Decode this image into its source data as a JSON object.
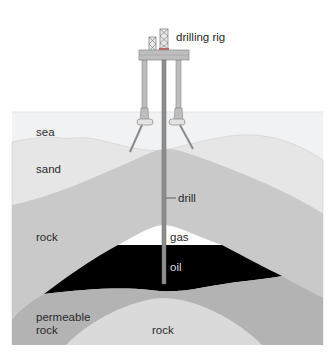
{
  "diagram": {
    "labels": {
      "drilling_rig": "drilling rig",
      "sea": "sea",
      "sand": "sand",
      "drill": "drill",
      "rock_upper": "rock",
      "gas": "gas",
      "oil": "oil",
      "permeable_rock_line1": "permeable",
      "permeable_rock_line2": "rock",
      "rock_lower": "rock"
    },
    "colors": {
      "background": "#ffffff",
      "sea": "#f1f2f4",
      "sand": "#e6e6e6",
      "rock_upper": "#c9c9c9",
      "gas": "#ffffff",
      "oil": "#000000",
      "permeable_rock": "#b3b3b3",
      "rock_lower": "#dadada",
      "rig_platform": "#bdbdbd",
      "rig_legs": "#a8a8a8",
      "derrick_accent": "#c06060",
      "drill_pipe": "#8e8e8e"
    }
  }
}
